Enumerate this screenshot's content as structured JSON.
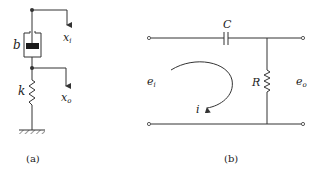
{
  "diagram_a": {
    "caption": "(a)",
    "damper_label": "b",
    "spring_label": "k",
    "input_label": "x",
    "input_sub": "i",
    "output_label": "x",
    "output_sub": "o"
  },
  "diagram_b": {
    "caption": "(b)",
    "capacitor_label": "C",
    "resistor_label": "R",
    "input_voltage_label": "e",
    "input_voltage_sub": "i",
    "output_voltage_label": "e",
    "output_voltage_sub": "o",
    "current_label": "i"
  },
  "colors": {
    "line": "#333333",
    "background": "#ffffff"
  }
}
